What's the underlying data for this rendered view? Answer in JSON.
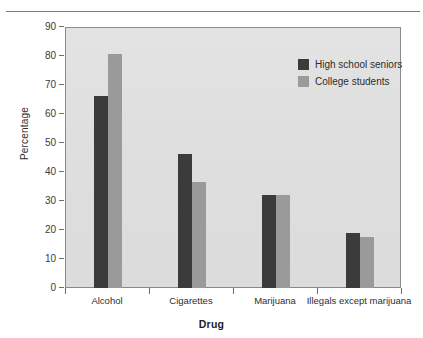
{
  "chart_data": {
    "type": "bar",
    "title": "",
    "xlabel": "Drug",
    "ylabel": "Percentage",
    "categories": [
      "Alcohol",
      "Cigarettes",
      "Marijuana",
      "Illegals except marijuana"
    ],
    "series": [
      {
        "name": "High school seniors",
        "color": "#3b3b3b",
        "values": [
          66.5,
          46.5,
          32.3,
          19.3
        ]
      },
      {
        "name": "College students",
        "color": "#9a9a9a",
        "values": [
          81,
          37,
          32.5,
          18
        ]
      }
    ],
    "ylim": [
      0,
      90
    ],
    "yticks": [
      0,
      10,
      20,
      30,
      40,
      50,
      60,
      70,
      80,
      90
    ],
    "ytick_labels": [
      "0",
      "10",
      "20",
      "30",
      "40",
      "50",
      "60",
      "70",
      "80",
      "90"
    ],
    "grid": false,
    "legend_position": "top-right",
    "plot_background": "#e0e0e0"
  }
}
